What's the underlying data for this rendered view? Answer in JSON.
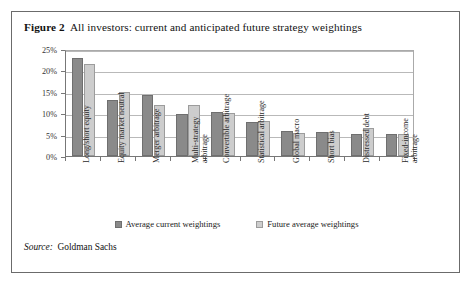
{
  "figure": {
    "label": "Figure 2",
    "title": "All investors: current and anticipated future strategy weightings",
    "source_label": "Source:",
    "source_value": "Goldman Sachs"
  },
  "legend": {
    "items": [
      {
        "name": "current-weightings",
        "label": "Average current weightings",
        "color": "#8a8a8a"
      },
      {
        "name": "future-weightings",
        "label": "Future average weightings",
        "color": "#cdcdcd"
      }
    ]
  },
  "axis": {
    "y_ticks": [
      "0%",
      "5%",
      "10%",
      "15%",
      "20%",
      "25%"
    ]
  },
  "chart_data": {
    "type": "bar",
    "title": "All investors: current and anticipated future strategy weightings",
    "xlabel": "",
    "ylabel": "",
    "ylim": [
      0,
      25
    ],
    "ytick_values": [
      0,
      5,
      10,
      15,
      20,
      25
    ],
    "ytick_labels": [
      "0%",
      "5%",
      "10%",
      "15%",
      "20%",
      "25%"
    ],
    "grid": true,
    "legend_position": "bottom",
    "categories": [
      "Long/short equity",
      "Equity market neutral",
      "Merger arbitrage",
      "Multi-strategy arbitrage",
      "Convertible arbitrage",
      "Statistical arbitrage",
      "Global macro",
      "Short bias",
      "Distressed debt",
      "Fixed-income arbitrage"
    ],
    "category_lines": [
      [
        "Long/short equity"
      ],
      [
        "Equity market neutral"
      ],
      [
        "Merger arbitrage"
      ],
      [
        "Multi-strategy",
        "arbitrage"
      ],
      [
        "Convertible arbitrage"
      ],
      [
        "Statistical arbitrage"
      ],
      [
        "Global macro"
      ],
      [
        "Short bias"
      ],
      [
        "Distressed debt"
      ],
      [
        "Fixed-income",
        "arbitrage"
      ]
    ],
    "series": [
      {
        "name": "Average current weightings",
        "color": "#8a8a8a",
        "values": [
          23.0,
          13.0,
          14.2,
          9.9,
          10.4,
          8.0,
          5.9,
          5.6,
          5.1,
          5.2
        ]
      },
      {
        "name": "Future average weightings",
        "color": "#cdcdcd",
        "values": [
          21.5,
          15.0,
          12.0,
          12.0,
          10.1,
          8.2,
          5.3,
          5.5,
          6.5,
          5.1
        ]
      }
    ],
    "source": "Source: Goldman Sachs"
  }
}
